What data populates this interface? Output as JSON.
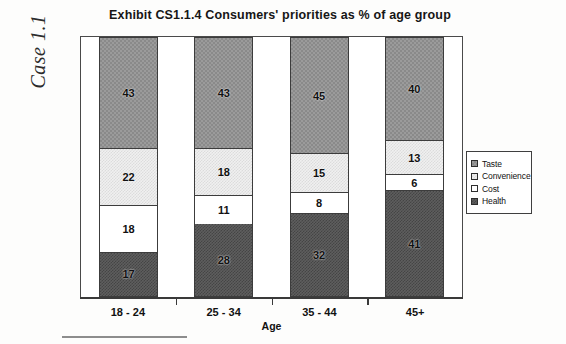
{
  "page": {
    "case_label": "Case 1.1"
  },
  "chart_data": {
    "type": "bar",
    "subtype": "stacked-column",
    "title": "Exhibit CS1.1.4  Consumers' priorities as % of age group",
    "xlabel": "Age",
    "ylabel": "",
    "ylim": [
      0,
      100
    ],
    "grid": false,
    "legend_position": "right",
    "categories": [
      "18 - 24",
      "25 - 34",
      "35 - 44",
      "45+"
    ],
    "stack_order_bottom_to_top": [
      "Health",
      "Cost",
      "Convenience",
      "Taste"
    ],
    "series": [
      {
        "name": "Health",
        "values": [
          17,
          28,
          32,
          41
        ],
        "color": "#5e5e5e",
        "swatch": "dark-gray-dither"
      },
      {
        "name": "Cost",
        "values": [
          18,
          11,
          8,
          6
        ],
        "color": "#ffffff",
        "swatch": "white"
      },
      {
        "name": "Convenience",
        "values": [
          22,
          18,
          15,
          13
        ],
        "color": "#f0f0f0",
        "swatch": "light-gray-dither"
      },
      {
        "name": "Taste",
        "values": [
          43,
          43,
          45,
          40
        ],
        "color": "#9b9b9b",
        "swatch": "medium-gray-dither"
      }
    ],
    "legend": [
      "Taste",
      "Convenience",
      "Cost",
      "Health"
    ],
    "bars": [
      {
        "category": "18 - 24",
        "segments": [
          {
            "name": "Taste",
            "value": 43,
            "label": "43"
          },
          {
            "name": "Convenience",
            "value": 22,
            "label": "22"
          },
          {
            "name": "Cost",
            "value": 18,
            "label": "18"
          },
          {
            "name": "Health",
            "value": 17,
            "label": "17"
          }
        ]
      },
      {
        "category": "25 - 34",
        "segments": [
          {
            "name": "Taste",
            "value": 43,
            "label": "43"
          },
          {
            "name": "Convenience",
            "value": 18,
            "label": "18"
          },
          {
            "name": "Cost",
            "value": 11,
            "label": "11"
          },
          {
            "name": "Health",
            "value": 28,
            "label": "28"
          }
        ]
      },
      {
        "category": "35 - 44",
        "segments": [
          {
            "name": "Taste",
            "value": 45,
            "label": "45"
          },
          {
            "name": "Convenience",
            "value": 15,
            "label": "15"
          },
          {
            "name": "Cost",
            "value": 8,
            "label": "8"
          },
          {
            "name": "Health",
            "value": 32,
            "label": "32"
          }
        ]
      },
      {
        "category": "45+",
        "segments": [
          {
            "name": "Taste",
            "value": 40,
            "label": "40"
          },
          {
            "name": "Convenience",
            "value": 13,
            "label": "13"
          },
          {
            "name": "Cost",
            "value": 6,
            "label": "6"
          },
          {
            "name": "Health",
            "value": 41,
            "label": "41"
          }
        ]
      }
    ]
  }
}
